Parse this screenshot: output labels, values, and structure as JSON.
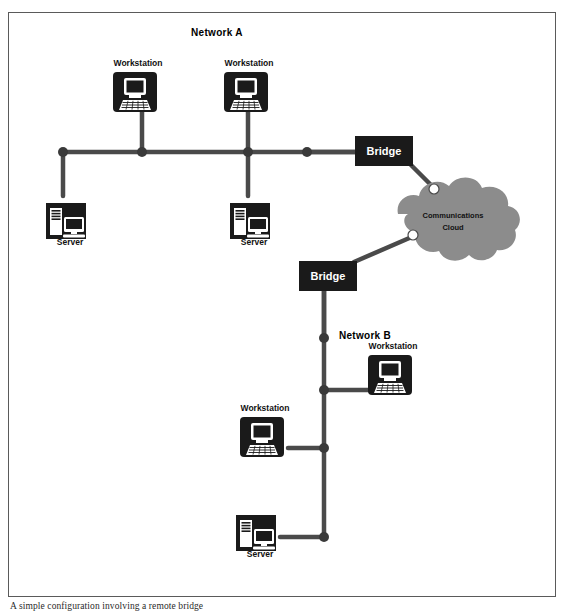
{
  "figure": {
    "caption": "A simple configuration involving a remote bridge",
    "border_color": "#5a5a5a",
    "background": "#ffffff"
  },
  "colors": {
    "line": "#4a4a4a",
    "node": "#3a3a3a",
    "device_fill": "#1a1a1a",
    "device_inner": "#ffffff",
    "cloud_fill": "#8c8c8c",
    "cloud_node": "#ffffff",
    "text": "#111111"
  },
  "network_labels": [
    {
      "name": "network-a-label",
      "text": "Network A",
      "x": 217,
      "y": 36
    },
    {
      "name": "network-b-label",
      "text": "Network B",
      "x": 365,
      "y": 339
    }
  ],
  "devices": [
    {
      "name": "workstation-a1",
      "type": "workstation",
      "label": "Workstation",
      "x": 113,
      "y": 72,
      "label_x": 138,
      "label_y": 66
    },
    {
      "name": "workstation-a2",
      "type": "workstation",
      "label": "Workstation",
      "x": 224,
      "y": 72,
      "label_x": 249,
      "label_y": 66
    },
    {
      "name": "server-a1",
      "type": "server",
      "label": "Server",
      "x": 42,
      "y": 191,
      "label_x": 70,
      "label_y": 245
    },
    {
      "name": "server-a2",
      "type": "server",
      "label": "Server",
      "x": 226,
      "y": 191,
      "label_x": 254,
      "label_y": 245
    },
    {
      "name": "workstation-b1",
      "type": "workstation",
      "label": "Workstation",
      "x": 368,
      "y": 355,
      "label_x": 393,
      "label_y": 349
    },
    {
      "name": "workstation-b2",
      "type": "workstation",
      "label": "Workstation",
      "x": 240,
      "y": 417,
      "label_x": 265,
      "label_y": 411
    },
    {
      "name": "server-b1",
      "type": "server",
      "label": "Server",
      "x": 232,
      "y": 503,
      "label_x": 260,
      "label_y": 557
    }
  ],
  "bridges": [
    {
      "name": "bridge-a",
      "label": "Bridge",
      "x": 355,
      "y": 136,
      "w": 58,
      "h": 30
    },
    {
      "name": "bridge-b",
      "label": "Bridge",
      "x": 299,
      "y": 261,
      "w": 58,
      "h": 30
    }
  ],
  "cloud": {
    "name": "communications-cloud",
    "label_line1": "Communications",
    "label_line2": "Cloud",
    "center_x": 455,
    "center_y": 220
  },
  "cloud_ports": [
    {
      "name": "cloud-port-upper",
      "x": 434,
      "y": 189
    },
    {
      "name": "cloud-port-lower",
      "x": 413,
      "y": 235
    }
  ],
  "bus_a": {
    "name": "network-a-bus",
    "y": 152,
    "x_start": 63,
    "x_end": 355,
    "nodes": [
      {
        "name": "bus-node-a-1",
        "x": 63,
        "y": 152
      },
      {
        "name": "bus-node-a-2",
        "x": 142,
        "y": 152
      },
      {
        "name": "bus-node-a-3",
        "x": 248,
        "y": 152
      },
      {
        "name": "bus-node-a-4",
        "x": 307,
        "y": 152
      }
    ]
  },
  "bus_b": {
    "name": "network-b-bus",
    "x": 324,
    "y_start": 291,
    "y_end": 537,
    "nodes": [
      {
        "name": "bus-node-b-1",
        "x": 324,
        "y": 338
      },
      {
        "name": "bus-node-b-2",
        "x": 324,
        "y": 390
      },
      {
        "name": "bus-node-b-3",
        "x": 324,
        "y": 448
      },
      {
        "name": "bus-node-b-4",
        "x": 324,
        "y": 537
      }
    ]
  },
  "links": [
    {
      "name": "link-ws-a1-to-bus",
      "x1": 142,
      "y1": 108,
      "x2": 142,
      "y2": 152
    },
    {
      "name": "link-ws-a2-to-bus",
      "x1": 248,
      "y1": 108,
      "x2": 248,
      "y2": 152
    },
    {
      "name": "link-bus-to-server-a1",
      "x1": 63,
      "y1": 152,
      "x2": 63,
      "y2": 196
    },
    {
      "name": "link-bus-to-server-a2",
      "x1": 248,
      "y1": 152,
      "x2": 248,
      "y2": 196
    },
    {
      "name": "link-bus-to-bridge-a",
      "x1": 307,
      "y1": 152,
      "x2": 358,
      "y2": 152
    },
    {
      "name": "link-bridge-a-to-cloud",
      "x1": 410,
      "y1": 164,
      "x2": 436,
      "y2": 190
    },
    {
      "name": "link-cloud-to-bridge-b",
      "x1": 414,
      "y1": 236,
      "x2": 354,
      "y2": 262
    },
    {
      "name": "link-bridge-b-to-bus",
      "x1": 324,
      "y1": 289,
      "x2": 324,
      "y2": 338
    },
    {
      "name": "link-bus-to-ws-b1",
      "x1": 324,
      "y1": 390,
      "x2": 372,
      "y2": 390
    },
    {
      "name": "link-ws-b2-to-bus",
      "x1": 288,
      "y1": 448,
      "x2": 324,
      "y2": 448
    },
    {
      "name": "link-server-b1-to-bus",
      "x1": 280,
      "y1": 537,
      "x2": 324,
      "y2": 537
    }
  ]
}
